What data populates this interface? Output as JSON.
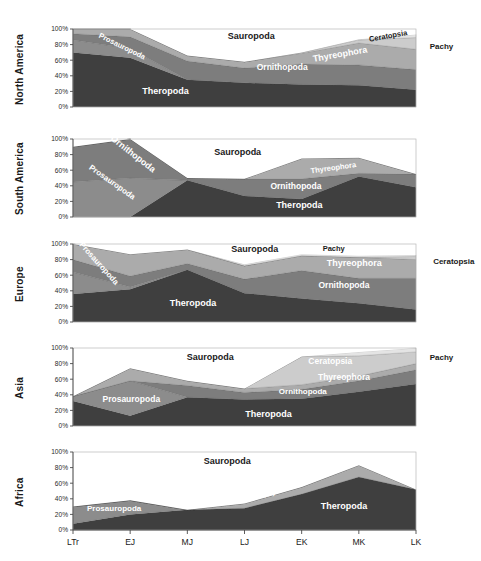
{
  "figure": {
    "title": "",
    "background": "#ffffff",
    "panel_count": 5
  },
  "axis": {
    "y_ticks": [
      "0%",
      "20%",
      "40%",
      "60%",
      "80%",
      "100%"
    ],
    "y_tick_values": [
      0,
      20,
      40,
      60,
      80,
      100
    ],
    "x_ticks": [
      "LTr",
      "EJ",
      "MJ",
      "LJ",
      "EK",
      "MK",
      "LK"
    ],
    "ylim": [
      0,
      100
    ],
    "grid": false
  },
  "colors": {
    "Theropoda": "#3f3f3f",
    "Prosauropoda": "#8c8c8c",
    "Ornithopoda": "#7d7d7d",
    "Thyreophora": "#ababab",
    "Ceratopsia": "#cccccc",
    "Pachy": "#e4e4e4",
    "Sauropoda": "#ffffff",
    "outline": "#555555",
    "text_dark": "#1a1a1a",
    "text_light": "#ffffff"
  },
  "chart_data": {
    "type": "area",
    "title": "",
    "xlabel": "",
    "ylabel": "",
    "ylim": [
      0,
      100
    ],
    "grid": false,
    "stacked": true,
    "x": [
      "LTr",
      "EJ",
      "MJ",
      "LJ",
      "EK",
      "MK",
      "LK"
    ],
    "legend_entries": [
      "Theropoda",
      "Prosauropoda",
      "Ornithopoda",
      "Thyreophora",
      "Ceratopsia",
      "Pachy",
      "Sauropoda"
    ],
    "legend_position": "inline-annotations",
    "panels": [
      {
        "name": "North America",
        "series": [
          {
            "name": "Theropoda",
            "values": [
              70,
              63,
              35,
              31,
              29,
              28,
              22
            ]
          },
          {
            "name": "Prosauropoda",
            "values": [
              16,
              12,
              0,
              0,
              0,
              0,
              0
            ]
          },
          {
            "name": "Ornithopoda",
            "values": [
              8,
              15,
              24,
              19,
              26,
              26,
              26
            ]
          },
          {
            "name": "Thyreophora",
            "values": [
              6,
              10,
              7,
              8,
              14,
              28,
              26
            ]
          },
          {
            "name": "Ceratopsia",
            "values": [
              0,
              0,
              0,
              0,
              1,
              4,
              15
            ]
          },
          {
            "name": "Pachy",
            "values": [
              0,
              0,
              0,
              0,
              0,
              1,
              4
            ]
          },
          {
            "name": "Sauropoda",
            "values": [
              0,
              0,
              34,
              42,
              30,
              13,
              7
            ]
          }
        ],
        "annotations": [
          {
            "text": "Theropoda",
            "x": 27,
            "y": 17,
            "style": "light-on-dark",
            "size": 9,
            "rotate": 0,
            "bold": true
          },
          {
            "text": "Prosauropoda",
            "x": 14,
            "y": 75,
            "style": "light-on-dark",
            "size": 7.5,
            "rotate": 26,
            "bold": true
          },
          {
            "text": "Sauropoda",
            "x": 52,
            "y": 87,
            "style": "dark-on-light",
            "size": 9,
            "rotate": 0,
            "bold": true
          },
          {
            "text": "Ornithopoda",
            "x": 61,
            "y": 48,
            "style": "light-on-dark",
            "size": 8.5,
            "rotate": 0,
            "bold": true
          },
          {
            "text": "Thyreophora",
            "x": 78,
            "y": 64,
            "style": "light-on-dark",
            "size": 9,
            "rotate": -10,
            "bold": true
          },
          {
            "text": "Ceratopsia",
            "x": 92,
            "y": 88,
            "style": "dark-on-light",
            "size": 7.5,
            "rotate": -10,
            "bold": false
          },
          {
            "text": "Pachy",
            "x": 104,
            "y": 74,
            "style": "outside",
            "size": 8,
            "rotate": 0,
            "bold": false
          }
        ]
      },
      {
        "name": "South America",
        "series": [
          {
            "name": "Theropoda",
            "values": [
              0,
              0,
              47,
              27,
              23,
              52,
              38
            ]
          },
          {
            "name": "Prosauropoda",
            "values": [
              45,
              50,
              0,
              0,
              0,
              0,
              0
            ]
          },
          {
            "name": "Ornithopoda",
            "values": [
              45,
              50,
              3,
              22,
              26,
              4,
              17
            ]
          },
          {
            "name": "Thyreophora",
            "values": [
              0,
              0,
              0,
              0,
              26,
              20,
              0
            ]
          },
          {
            "name": "Ceratopsia",
            "values": [
              0,
              0,
              0,
              0,
              0,
              0,
              0
            ]
          },
          {
            "name": "Pachy",
            "values": [
              0,
              0,
              0,
              0,
              0,
              0,
              0
            ]
          },
          {
            "name": "Sauropoda",
            "values": [
              10,
              0,
              50,
              51,
              25,
              24,
              45
            ]
          }
        ],
        "annotations": [
          {
            "text": "Ornithopoda",
            "x": 17,
            "y": 78,
            "style": "light-on-dark",
            "size": 9,
            "rotate": 38,
            "bold": true
          },
          {
            "text": "Prosauropoda",
            "x": 11,
            "y": 42,
            "style": "light-on-dark",
            "size": 8,
            "rotate": 35,
            "bold": true
          },
          {
            "text": "Sauropoda",
            "x": 48,
            "y": 80,
            "style": "dark-on-light",
            "size": 9,
            "rotate": 0,
            "bold": true
          },
          {
            "text": "Thyreophora",
            "x": 76,
            "y": 60,
            "style": "light-on-dark",
            "size": 7.5,
            "rotate": -8,
            "bold": true
          },
          {
            "text": "Ornithopoda",
            "x": 65,
            "y": 36,
            "style": "light-on-dark",
            "size": 8.5,
            "rotate": 0,
            "bold": true
          },
          {
            "text": "Theropoda",
            "x": 66,
            "y": 12,
            "style": "light-on-dark",
            "size": 9,
            "rotate": 0,
            "bold": true
          }
        ]
      },
      {
        "name": "Europe",
        "series": [
          {
            "name": "Theropoda",
            "values": [
              36,
              42,
              67,
              37,
              30,
              24,
              16
            ]
          },
          {
            "name": "Prosauropoda",
            "values": [
              28,
              3,
              0,
              0,
              0,
              0,
              0
            ]
          },
          {
            "name": "Ornithopoda",
            "values": [
              16,
              14,
              8,
              18,
              36,
              32,
              40
            ]
          },
          {
            "name": "Thyreophora",
            "values": [
              20,
              28,
              18,
              17,
              19,
              27,
              24
            ]
          },
          {
            "name": "Ceratopsia",
            "values": [
              0,
              0,
              0,
              0,
              0,
              0,
              4
            ]
          },
          {
            "name": "Pachy",
            "values": [
              0,
              0,
              0,
              2,
              2,
              2,
              2
            ]
          },
          {
            "name": "Sauropoda",
            "values": [
              0,
              13,
              7,
              26,
              13,
              15,
              14
            ]
          }
        ],
        "annotations": [
          {
            "text": "Prosauropoda",
            "x": 7,
            "y": 73,
            "style": "light-on-dark",
            "size": 8,
            "rotate": 48,
            "bold": true
          },
          {
            "text": "Theropoda",
            "x": 35,
            "y": 20,
            "style": "light-on-dark",
            "size": 9,
            "rotate": 0,
            "bold": true
          },
          {
            "text": "Sauropoda",
            "x": 53,
            "y": 90,
            "style": "dark-on-light",
            "size": 9,
            "rotate": 0,
            "bold": true
          },
          {
            "text": "Pachy",
            "x": 76,
            "y": 91,
            "style": "dark-on-light",
            "size": 7.5,
            "rotate": 0,
            "bold": false
          },
          {
            "text": "Thyreophora",
            "x": 82,
            "y": 72,
            "style": "light-on-dark",
            "size": 9,
            "rotate": 0,
            "bold": true
          },
          {
            "text": "Ornithopoda",
            "x": 79,
            "y": 44,
            "style": "light-on-dark",
            "size": 8.5,
            "rotate": 0,
            "bold": true
          },
          {
            "text": "Ceratopsia",
            "x": 105,
            "y": 75,
            "style": "outside",
            "size": 8,
            "rotate": 0,
            "bold": false
          }
        ]
      },
      {
        "name": "Asia",
        "series": [
          {
            "name": "Theropoda",
            "values": [
              32,
              13,
              37,
              34,
              35,
              44,
              54
            ]
          },
          {
            "name": "Prosauropoda",
            "values": [
              6,
              45,
              0,
              0,
              0,
              0,
              0
            ]
          },
          {
            "name": "Ornithopoda",
            "values": [
              0,
              0,
              15,
              9,
              12,
              14,
              18
            ]
          },
          {
            "name": "Thyreophora",
            "values": [
              0,
              16,
              6,
              5,
              6,
              6,
              8
            ]
          },
          {
            "name": "Ceratopsia",
            "values": [
              0,
              0,
              0,
              0,
              36,
              26,
              15
            ]
          },
          {
            "name": "Pachy",
            "values": [
              0,
              0,
              0,
              0,
              0,
              5,
              5
            ]
          },
          {
            "name": "Sauropoda",
            "values": [
              62,
              26,
              42,
              52,
              11,
              5,
              0
            ]
          }
        ],
        "annotations": [
          {
            "text": "Sauropoda",
            "x": 40,
            "y": 84,
            "style": "dark-on-light",
            "size": 9,
            "rotate": 0,
            "bold": true
          },
          {
            "text": "Prosauropoda",
            "x": 17,
            "y": 31,
            "style": "light-on-dark",
            "size": 8.5,
            "rotate": 0,
            "bold": true
          },
          {
            "text": "Theropoda",
            "x": 57,
            "y": 11,
            "style": "light-on-dark",
            "size": 9,
            "rotate": 0,
            "bold": true
          },
          {
            "text": "Ceratopsia",
            "x": 75,
            "y": 79,
            "style": "light-on-dark",
            "size": 8.5,
            "rotate": 0,
            "bold": true
          },
          {
            "text": "Thyreophora",
            "x": 79,
            "y": 59,
            "style": "light-on-dark",
            "size": 8.5,
            "rotate": 0,
            "bold": true
          },
          {
            "text": "Ornithopoda",
            "x": 67,
            "y": 41,
            "style": "light-on-dark",
            "size": 8,
            "rotate": 0,
            "bold": true
          },
          {
            "text": "Pachy",
            "x": 104,
            "y": 84,
            "style": "outside",
            "size": 8,
            "rotate": 0,
            "bold": false
          }
        ]
      },
      {
        "name": "Africa",
        "series": [
          {
            "name": "Theropoda",
            "values": [
              8,
              20,
              26,
              28,
              46,
              68,
              52
            ]
          },
          {
            "name": "Prosauropoda",
            "values": [
              22,
              18,
              0,
              0,
              0,
              0,
              0
            ]
          },
          {
            "name": "Ornithopoda",
            "values": [
              0,
              0,
              0,
              0,
              0,
              0,
              0
            ]
          },
          {
            "name": "Thyreophora",
            "values": [
              0,
              0,
              0,
              6,
              9,
              15,
              0
            ]
          },
          {
            "name": "Ceratopsia",
            "values": [
              0,
              0,
              0,
              0,
              0,
              0,
              0
            ]
          },
          {
            "name": "Pachy",
            "values": [
              0,
              0,
              0,
              0,
              0,
              0,
              0
            ]
          },
          {
            "name": "Sauropoda",
            "values": [
              50,
              40,
              74,
              66,
              45,
              17,
              48
            ]
          }
        ],
        "annotations": [
          {
            "text": "Ornithopoda",
            "x": 12,
            "y": 62,
            "style": "light-on-dark",
            "size": 9,
            "rotate": 20,
            "bold": true
          },
          {
            "text": "Prosauropoda",
            "x": 12,
            "y": 25,
            "style": "light-on-dark",
            "size": 8,
            "rotate": 0,
            "bold": true
          },
          {
            "text": "Sauropoda",
            "x": 45,
            "y": 85,
            "style": "dark-on-light",
            "size": 9,
            "rotate": 0,
            "bold": true
          },
          {
            "text": "Thyreophora",
            "x": 62,
            "y": 52,
            "style": "light-on-dark",
            "size": 8,
            "rotate": -22,
            "bold": true
          },
          {
            "text": "Theropoda",
            "x": 79,
            "y": 27,
            "style": "light-on-dark",
            "size": 9,
            "rotate": 0,
            "bold": true
          }
        ]
      }
    ]
  }
}
